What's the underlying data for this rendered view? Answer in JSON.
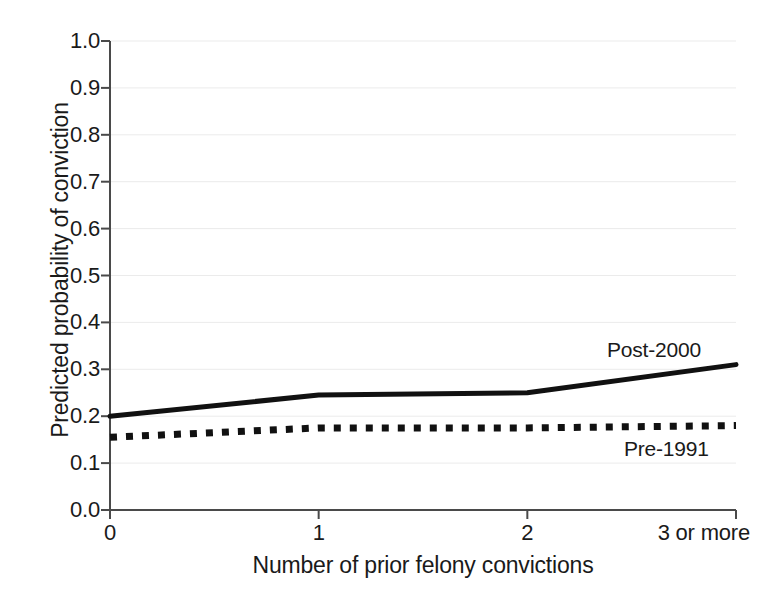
{
  "chart_data": {
    "type": "line",
    "title": "",
    "xlabel": "Number of prior felony convictions",
    "ylabel": "Predicted probability of conviction",
    "categories": [
      "0",
      "1",
      "2",
      "3 or more"
    ],
    "x": [
      0,
      1,
      2,
      3
    ],
    "xtick_labels": [
      "0",
      "1",
      "2",
      "3 or more"
    ],
    "ytick_labels": [
      "0.0",
      "0.1",
      "0.2",
      "0.3",
      "0.4",
      "0.5",
      "0.6",
      "0.7",
      "0.8",
      "0.9",
      "1.0"
    ],
    "ytick_values": [
      0.0,
      0.1,
      0.2,
      0.3,
      0.4,
      0.5,
      0.6,
      0.7,
      0.8,
      0.9,
      1.0
    ],
    "ylim": [
      0.0,
      1.0
    ],
    "xlim": [
      0,
      3
    ],
    "grid": true,
    "grid_color": "#ebebeb",
    "legend_position": "inline-annotation",
    "series": [
      {
        "name": "Post-2000",
        "style": "solid",
        "color": "#111111",
        "values": [
          0.2,
          0.245,
          0.25,
          0.31
        ]
      },
      {
        "name": "Pre-1991",
        "style": "dotted",
        "color": "#111111",
        "values": [
          0.155,
          0.175,
          0.175,
          0.18
        ]
      }
    ],
    "annotations": [
      {
        "text": "Post-2000",
        "series": "Post-2000"
      },
      {
        "text": "Pre-1991",
        "series": "Pre-1991"
      }
    ]
  }
}
